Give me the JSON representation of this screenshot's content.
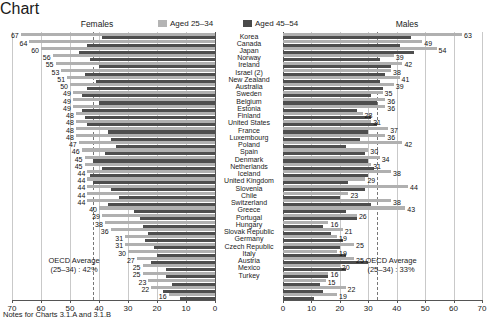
{
  "header": {
    "females_title": "Females",
    "males_title": "Males"
  },
  "legend": {
    "position": "top-center",
    "items": [
      {
        "label": "Aged 25–34",
        "color": "#b0b0b0",
        "key": "aged_25_34"
      },
      {
        "label": "Aged 45–54",
        "color": "#4e4e4e",
        "key": "aged_45_54"
      }
    ]
  },
  "annotations": {
    "females_oecd_line1": "OECD Average",
    "females_oecd_line2": "(25–34) : 42%",
    "males_oecd_line1": "OECD Average",
    "males_oecd_line2": "(25–34) : 33%"
  },
  "footer": {
    "note": "Notes for Charts 3.1.A and 3.1.B"
  },
  "axis": {
    "females_ticks": [
      "70",
      "60",
      "50",
      "40",
      "30",
      "20",
      "10",
      "0"
    ],
    "males_ticks": [
      "0",
      "10",
      "20",
      "30",
      "40",
      "50",
      "60",
      "70"
    ]
  },
  "chart_data": {
    "type": "bar",
    "orientation": "horizontal",
    "layout": "back-to-back population pyramid, Females reversed axis on left, Males on right",
    "title": "",
    "xlabel": "",
    "ylabel": "",
    "xlim": [
      0,
      70
    ],
    "grid": true,
    "legend": [
      "Aged 25–34",
      "Aged 45–54"
    ],
    "legend_position": "top-center",
    "categories": [
      "Korea",
      "Canada",
      "Japan",
      "Norway",
      "Ireland",
      "Israel (2)",
      "New Zealand",
      "Australia",
      "Sweden",
      "Belgium",
      "Estonia",
      "Finland",
      "United States",
      "France",
      "Luxembourg",
      "Poland",
      "Spain",
      "Denmark",
      "Netherlands",
      "Iceland",
      "United Kingdom",
      "Slovenia",
      "Chile",
      "Switzerland",
      "Greece",
      "Portugal",
      "Hungary",
      "Slovak Republic",
      "Germany",
      "Czech Republic",
      "Italy",
      "Austria",
      "Mexico",
      "Turkey"
    ],
    "panels": [
      {
        "name": "Females",
        "axis_reversed": true,
        "oecd_average_25_34": 42,
        "series": [
          {
            "name": "Aged 25–34",
            "labeled": true,
            "values": [
              67,
              64,
              60,
              56,
              55,
              53,
              51,
              50,
              49,
              49,
              49,
              48,
              48,
              48,
              48,
              47,
              46,
              45,
              45,
              44,
              44,
              44,
              44,
              44,
              40,
              39,
              38,
              36,
              31,
              31,
              30,
              27,
              25,
              25
            ]
          },
          {
            "name": "Aged 45–54",
            "labeled": false,
            "values": [
              39,
              43,
              46,
              42,
              40,
              38,
              40,
              41,
              45,
              40,
              44,
              43,
              44,
              38,
              34,
              38,
              33,
              42,
              39,
              43,
              40,
              36,
              26,
              31,
              28,
              26,
              25,
              23,
              24,
              21,
              20,
              22,
              17,
              17
            ]
          }
        ]
      },
      {
        "name": "Males",
        "axis_reversed": false,
        "oecd_average_25_34": 33,
        "series": [
          {
            "name": "Aged 25–34",
            "labeled": true,
            "values": [
              63,
              49,
              54,
              39,
              42,
              38,
              41,
              39,
              35,
              36,
              36,
              28,
              31,
              37,
              36,
              42,
              30,
              34,
              31,
              38,
              29,
              44,
              23,
              38,
              43,
              26,
              16,
              21,
              19,
              25,
              19,
              25,
              20,
              16
            ]
          },
          {
            "name": "Aged 45–54",
            "labeled": false,
            "values": [
              45,
              40,
              45,
              34,
              38,
              36,
              34,
              35,
              31,
              33,
              26,
              31,
              33,
              30,
              27,
              22,
              29,
              30,
              32,
              30,
              23,
              29,
              20,
              31,
              22,
              26,
              14,
              17,
              21,
              20,
              22,
              30,
              22,
              16
            ]
          }
        ]
      }
    ],
    "labeled_values_females": [
      67,
      64,
      60,
      56,
      55,
      53,
      51,
      50,
      49,
      49,
      49,
      48,
      48,
      48,
      48,
      47,
      46,
      45,
      45,
      44,
      44,
      44,
      44,
      44,
      40,
      39,
      38,
      36,
      31,
      31,
      30,
      27,
      25,
      25,
      23,
      22,
      16
    ],
    "labeled_values_males": [
      63,
      49,
      54,
      39,
      42,
      38,
      41,
      39,
      35,
      36,
      36,
      28,
      31,
      37,
      36,
      42,
      30,
      34,
      31,
      38,
      29,
      44,
      23,
      38,
      43,
      26,
      16,
      21,
      19,
      25,
      19,
      25,
      20,
      16,
      15,
      22,
      19
    ]
  },
  "rows": [
    {
      "country": "Korea",
      "f_25_34": 67,
      "f_45_54": 39,
      "m_25_34": 63,
      "m_45_54": 45
    },
    {
      "country": "Canada",
      "f_25_34": 64,
      "f_45_54": 44,
      "m_25_34": 49,
      "m_45_54": 41
    },
    {
      "country": "Japan",
      "f_25_34": 60,
      "f_45_54": 47,
      "m_25_34": 54,
      "m_45_54": 46
    },
    {
      "country": "Norway",
      "f_25_34": 56,
      "f_45_54": 43,
      "m_25_34": 39,
      "m_45_54": 34
    },
    {
      "country": "Ireland",
      "f_25_34": 55,
      "f_45_54": 40,
      "m_25_34": 42,
      "m_45_54": 38
    },
    {
      "country": "Israel (2)",
      "f_25_34": 53,
      "f_45_54": 45,
      "m_25_34": 38,
      "m_45_54": 36
    },
    {
      "country": "New Zealand",
      "f_25_34": 51,
      "f_45_54": 41,
      "m_25_34": 41,
      "m_45_54": 34
    },
    {
      "country": "Australia",
      "f_25_34": 50,
      "f_45_54": 44,
      "m_25_34": 39,
      "m_45_54": 35
    },
    {
      "country": "Sweden",
      "f_25_34": 49,
      "f_45_54": 46,
      "m_25_34": 35,
      "m_45_54": 31
    },
    {
      "country": "Belgium",
      "f_25_34": 49,
      "f_45_54": 40,
      "m_25_34": 36,
      "m_45_54": 33
    },
    {
      "country": "Estonia",
      "f_25_34": 49,
      "f_45_54": 46,
      "m_25_34": 36,
      "m_45_54": 26
    },
    {
      "country": "Finland",
      "f_25_34": 48,
      "f_45_54": 45,
      "m_25_34": 28,
      "m_45_54": 31
    },
    {
      "country": "United States",
      "f_25_34": 48,
      "f_45_54": 44,
      "m_25_34": 31,
      "m_45_54": 33
    },
    {
      "country": "France",
      "f_25_34": 48,
      "f_45_54": 37,
      "m_25_34": 37,
      "m_45_54": 30
    },
    {
      "country": "Luxembourg",
      "f_25_34": 48,
      "f_45_54": 36,
      "m_25_34": 36,
      "m_45_54": 27
    },
    {
      "country": "Poland",
      "f_25_34": 47,
      "f_45_54": 34,
      "m_25_34": 42,
      "m_45_54": 22
    },
    {
      "country": "Spain",
      "f_25_34": 46,
      "f_45_54": 38,
      "m_25_34": 30,
      "m_45_54": 29
    },
    {
      "country": "Denmark",
      "f_25_34": 45,
      "f_45_54": 42,
      "m_25_34": 34,
      "m_45_54": 30
    },
    {
      "country": "Netherlands",
      "f_25_34": 45,
      "f_45_54": 39,
      "m_25_34": 31,
      "m_45_54": 32
    },
    {
      "country": "Iceland",
      "f_25_34": 44,
      "f_45_54": 43,
      "m_25_34": 38,
      "m_45_54": 30
    },
    {
      "country": "United Kingdom",
      "f_25_34": 44,
      "f_45_54": 42,
      "m_25_34": 29,
      "m_45_54": 23
    },
    {
      "country": "Slovenia",
      "f_25_34": 44,
      "f_45_54": 36,
      "m_25_34": 44,
      "m_45_54": 29
    },
    {
      "country": "Chile",
      "f_25_34": 44,
      "f_45_54": 33,
      "m_25_34": 23,
      "m_45_54": 20
    },
    {
      "country": "Switzerland",
      "f_25_34": 44,
      "f_45_54": 37,
      "m_25_34": 38,
      "m_45_54": 31
    },
    {
      "country": "Greece",
      "f_25_34": 40,
      "f_45_54": 28,
      "m_25_34": 43,
      "m_45_54": 22
    },
    {
      "country": "Portugal",
      "f_25_34": 39,
      "f_45_54": 26,
      "m_25_34": 26,
      "m_45_54": 26
    },
    {
      "country": "Hungary",
      "f_25_34": 38,
      "f_45_54": 25,
      "m_25_34": 16,
      "m_45_54": 14
    },
    {
      "country": "Slovak Republic",
      "f_25_34": 36,
      "f_45_54": 23,
      "m_25_34": 21,
      "m_45_54": 17
    },
    {
      "country": "Germany",
      "f_25_34": 31,
      "f_45_54": 24,
      "m_25_34": 19,
      "m_45_54": 21
    },
    {
      "country": "Czech Republic",
      "f_25_34": 31,
      "f_45_54": 21,
      "m_25_34": 25,
      "m_45_54": 20
    },
    {
      "country": "Italy",
      "f_25_34": 30,
      "f_45_54": 20,
      "m_25_34": 19,
      "m_45_54": 22
    },
    {
      "country": "Austria",
      "f_25_34": 27,
      "f_45_54": 22,
      "m_25_34": 25,
      "m_45_54": 30
    },
    {
      "country": "Mexico",
      "f_25_34": 25,
      "f_45_54": 17,
      "m_25_34": 20,
      "m_45_54": 22
    },
    {
      "country": "Turkey",
      "f_25_34": 25,
      "f_45_54": 17,
      "m_25_34": 16,
      "m_45_54": 16
    },
    {
      "country": "",
      "f_25_34": 23,
      "f_45_54": 15,
      "m_25_34": 15,
      "m_45_54": 13
    },
    {
      "country": "",
      "f_25_34": 22,
      "f_45_54": 18,
      "m_25_34": 22,
      "m_45_54": 14
    },
    {
      "country": "",
      "f_25_34": 16,
      "f_45_54": 12,
      "m_25_34": 19,
      "m_45_54": 11
    }
  ]
}
